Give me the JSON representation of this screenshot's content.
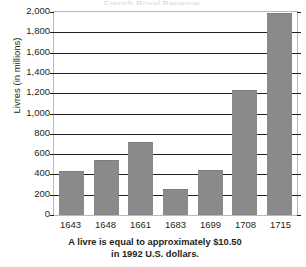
{
  "figure": {
    "title_remnant": "French Royal Revenue",
    "caption_line1": "A livre is equal to approximately $10.50",
    "caption_line2": "in 1992 U.S. dollars."
  },
  "chart_data": {
    "type": "bar",
    "title": "",
    "xlabel": "",
    "ylabel": "Livres (in millions)",
    "categories": [
      "1643",
      "1648",
      "1661",
      "1683",
      "1699",
      "1708",
      "1715"
    ],
    "values": [
      435,
      540,
      720,
      260,
      440,
      1230,
      1990
    ],
    "ylim": [
      0,
      2000
    ],
    "ytick_labels": [
      "0",
      "200",
      "400",
      "600",
      "800",
      "1,000",
      "1,200",
      "1,400",
      "1,600",
      "1,800",
      "2,000"
    ],
    "ytick_values": [
      0,
      200,
      400,
      600,
      800,
      1000,
      1200,
      1400,
      1600,
      1800,
      2000
    ],
    "grid": true,
    "legend": null,
    "bar_color": "#8a8a8a",
    "axis_color": "#231f20",
    "frame_color": "#b9b9b9",
    "background": "#ffffff"
  }
}
